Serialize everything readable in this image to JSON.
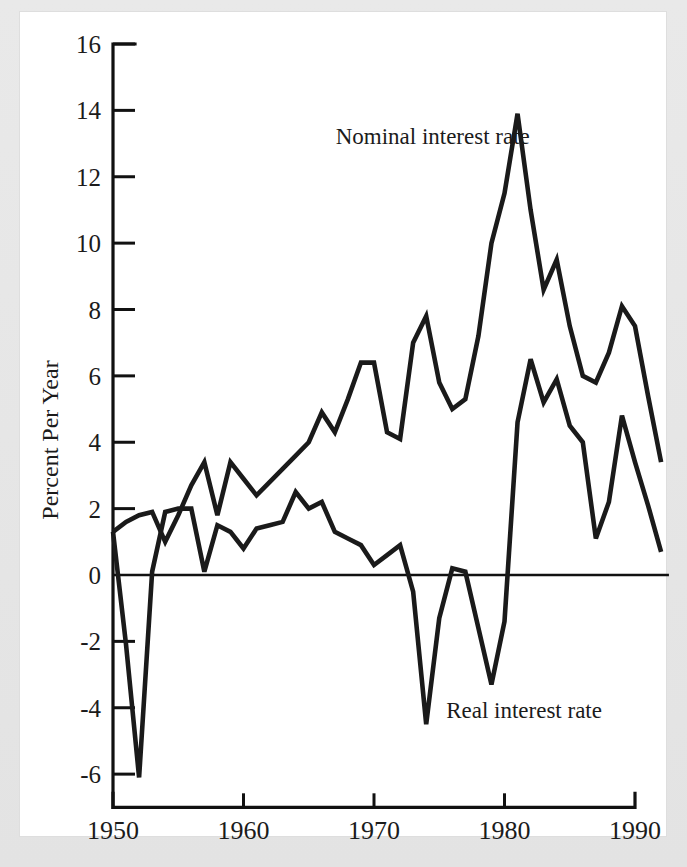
{
  "chart_data": {
    "type": "line",
    "title": "",
    "xlabel": "",
    "ylabel": "Percent Per Year",
    "xlim": [
      1950,
      1992
    ],
    "ylim": [
      -7,
      16
    ],
    "grid": false,
    "legend_position": "inline-annotations",
    "xticks": [
      1950,
      1960,
      1970,
      1980,
      1990
    ],
    "xticklabels": [
      "1950",
      "1960",
      "1970",
      "1980",
      "1990"
    ],
    "yticks": [
      -6,
      -4,
      -2,
      0,
      2,
      4,
      6,
      8,
      10,
      12,
      14,
      16
    ],
    "yticklabels": [
      "-6",
      "-4",
      "-2",
      "0",
      "2",
      "4",
      "6",
      "8",
      "10",
      "12",
      "14",
      "16"
    ],
    "zero_line": 0,
    "annotations": [
      {
        "text": "Nominal interest rate",
        "x": 1974.5,
        "y": 13.0
      },
      {
        "text": "Real interest rate",
        "x": 1981.5,
        "y": -4.3
      }
    ],
    "x": [
      1950,
      1951,
      1952,
      1953,
      1954,
      1955,
      1956,
      1957,
      1958,
      1959,
      1960,
      1961,
      1962,
      1963,
      1964,
      1965,
      1966,
      1967,
      1968,
      1969,
      1970,
      1971,
      1972,
      1973,
      1974,
      1975,
      1976,
      1977,
      1978,
      1979,
      1980,
      1981,
      1982,
      1983,
      1984,
      1985,
      1986,
      1987,
      1988,
      1989,
      1990,
      1991,
      1992
    ],
    "series": [
      {
        "name": "Nominal interest rate",
        "color": "#1a1a1a",
        "values": [
          1.3,
          1.6,
          1.8,
          1.9,
          1.0,
          1.8,
          2.7,
          3.4,
          1.8,
          3.4,
          2.9,
          2.4,
          2.8,
          3.2,
          3.6,
          4.0,
          4.9,
          4.3,
          5.3,
          6.4,
          6.4,
          4.3,
          4.1,
          7.0,
          7.8,
          5.8,
          5.0,
          5.3,
          7.2,
          10.0,
          11.5,
          13.9,
          11.0,
          8.6,
          9.5,
          7.5,
          6.0,
          5.8,
          6.7,
          8.1,
          7.5,
          5.4,
          3.4
        ]
      },
      {
        "name": "Real interest rate",
        "color": "#1a1a1a",
        "values": [
          1.3,
          -2.1,
          -6.1,
          0.1,
          1.9,
          2.0,
          2.0,
          0.1,
          1.5,
          1.3,
          0.8,
          1.4,
          1.5,
          1.6,
          2.5,
          2.0,
          2.2,
          1.3,
          1.1,
          0.9,
          0.3,
          0.6,
          0.9,
          -0.5,
          -4.5,
          -1.3,
          0.2,
          0.1,
          -1.6,
          -3.3,
          -1.4,
          4.6,
          6.5,
          5.2,
          5.9,
          4.5,
          4.0,
          1.1,
          2.2,
          4.8,
          3.4,
          2.1,
          0.7
        ]
      }
    ]
  },
  "axis": {
    "y_title": "Percent Per Year"
  },
  "annotations": {
    "nominal_label": "Nominal interest rate",
    "real_label": "Real interest rate"
  },
  "colors": {
    "line": "#1a1a1a",
    "axis": "#111111",
    "page": "#ffffff",
    "border": "#e3e3e3"
  }
}
